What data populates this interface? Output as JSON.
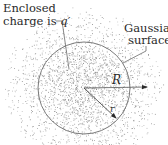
{
  "figure": {
    "width": 168,
    "height": 145,
    "background": "#ffffff",
    "dot_color": "#8a8a8a",
    "line_color": "#6a6a6a",
    "sphere": {
      "cx": 84,
      "cy": 88,
      "r": 46
    },
    "charge_cloud": {
      "cx": 84,
      "cy": 86,
      "extent": 80,
      "dot_count": 2600,
      "core_sigma": 34
    },
    "labels": {
      "enclosed_line1": "Enclosed",
      "enclosed_line2_prefix": "charge is ",
      "enclosed_symbol": "q′",
      "gaussian_line1": "Gaussian",
      "gaussian_line2": "surface",
      "big_radius": "R",
      "small_radius": "r"
    }
  }
}
